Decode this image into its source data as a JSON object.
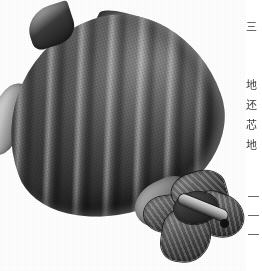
{
  "page": {
    "kind": "scanned-botanical-plate",
    "background_color": "#ffffff",
    "width": 262,
    "height": 271
  },
  "illustration": {
    "caption": "",
    "subject": "flower-bud",
    "medium": "halftone engraving / pencil shading",
    "palette": {
      "paper": "#ffffff",
      "body_dark": "#141414",
      "body_mid": "#4c4c4c",
      "body_light": "#8d8d8d",
      "highlight": "#ededed",
      "outline": "#1a1a1a"
    },
    "parts": [
      {
        "name": "bud-body",
        "label": "ribbed bud body"
      },
      {
        "name": "sepal-top-left",
        "label": "upper-left sepal tip"
      },
      {
        "name": "sepal-top-right",
        "label": "long upper-right sepal tip"
      },
      {
        "name": "sepal-left",
        "label": "pale left sepal blade"
      },
      {
        "name": "calyx",
        "label": "calyx lobes at base"
      },
      {
        "name": "stem",
        "label": "peduncle / stem"
      }
    ]
  },
  "text_column": {
    "orientation": "vertical-right-to-left",
    "note": "characters cropped at the right page edge",
    "entries": [
      {
        "char": "三",
        "top": 22
      },
      {
        "char": "地",
        "top": 80
      },
      {
        "char": "还",
        "top": 100
      },
      {
        "char": "芯",
        "top": 120
      },
      {
        "char": "地",
        "top": 140
      }
    ],
    "marks": [
      {
        "top": 196
      },
      {
        "top": 215
      },
      {
        "top": 234
      }
    ]
  }
}
